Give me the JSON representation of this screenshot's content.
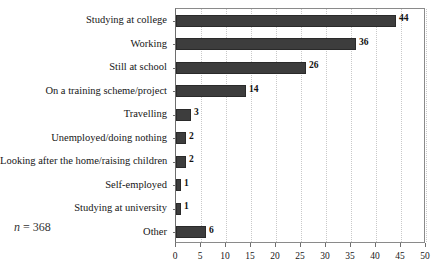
{
  "chart_data": {
    "type": "bar",
    "orientation": "horizontal",
    "title": "",
    "subtitle": "",
    "xlabel": "",
    "ylabel": "",
    "xlim": [
      0,
      50
    ],
    "xticks": [
      0,
      5,
      10,
      15,
      20,
      25,
      30,
      35,
      40,
      45,
      50
    ],
    "xtick_labels": [
      "0",
      "5",
      "10",
      "15",
      "20",
      "25",
      "30",
      "35",
      "40",
      "45",
      "50"
    ],
    "grid": "vertical-dotted",
    "legend": null,
    "categories": [
      "Studying at college",
      "Working",
      "Still at school",
      "On a training scheme/project",
      "Travelling",
      "Unemployed/doing nothing",
      "Looking after the home/raising children",
      "Self-employed",
      "Studying at university",
      "Other"
    ],
    "values": [
      44,
      36,
      26,
      14,
      3,
      2,
      2,
      1,
      1,
      6
    ],
    "value_labels": [
      "44",
      "36",
      "26",
      "14",
      "3",
      "2",
      "2",
      "1",
      "1",
      "6"
    ],
    "bar_color": "#3d3d3d",
    "annotations": [
      {
        "name": "sample-size",
        "variable": "n",
        "separator": " = ",
        "value": "368",
        "text": "n = 368"
      }
    ]
  }
}
